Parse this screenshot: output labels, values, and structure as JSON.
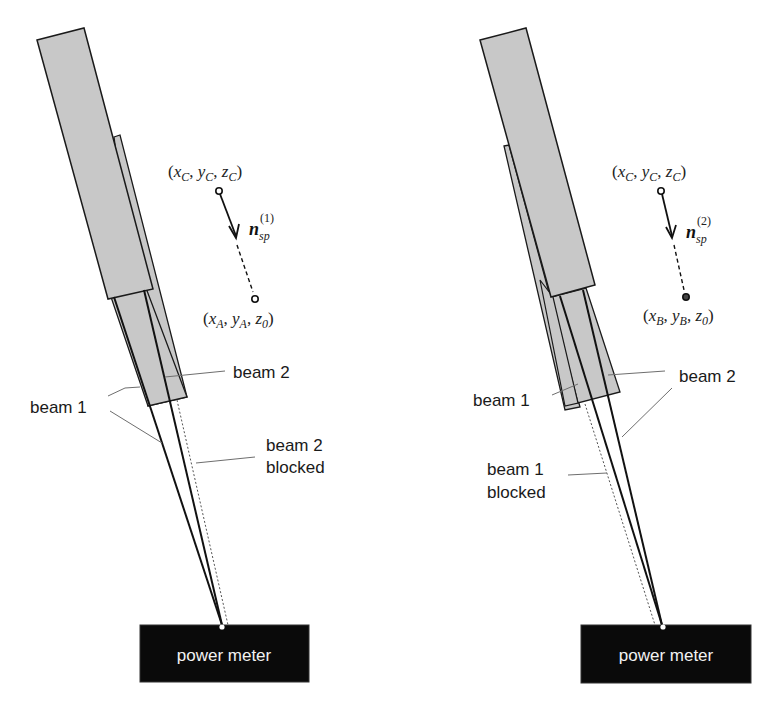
{
  "figure": {
    "colors": {
      "tube_fill": "#c8c8c8",
      "outline": "#1a1a1a",
      "leader_line": "#6e6e6e",
      "meter_fill": "#0a0a0a",
      "meter_text": "#f2f2f2"
    },
    "panels": [
      {
        "id": "left",
        "point_top": {
          "x": "x",
          "x_sub": "C",
          "y": "y",
          "y_sub": "C",
          "z": "z",
          "z_sub": "C"
        },
        "point_bottom": {
          "x": "x",
          "x_sub": "A",
          "y": "y",
          "y_sub": "A",
          "z": "z",
          "z_sub": "0"
        },
        "vector": {
          "symbol": "n",
          "subscript": "sp",
          "superscript": "(1)"
        },
        "labels": {
          "beam_a": "beam 1",
          "beam_b": "beam 2",
          "blocked_line1": "beam 2",
          "blocked_line2": "blocked"
        },
        "meter_label": "power meter"
      },
      {
        "id": "right",
        "point_top": {
          "x": "x",
          "x_sub": "C",
          "y": "y",
          "y_sub": "C",
          "z": "z",
          "z_sub": "C"
        },
        "point_bottom": {
          "x": "x",
          "x_sub": "B",
          "y": "y",
          "y_sub": "B",
          "z": "z",
          "z_sub": "0"
        },
        "vector": {
          "symbol": "n",
          "subscript": "sp",
          "superscript": "(2)"
        },
        "labels": {
          "beam_a": "beam 1",
          "beam_b": "beam 2",
          "blocked_line1": "beam 1",
          "blocked_line2": "blocked"
        },
        "meter_label": "power meter"
      }
    ]
  }
}
